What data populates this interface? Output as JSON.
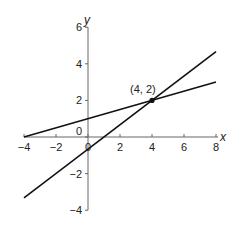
{
  "chart_data": {
    "type": "line",
    "title": "",
    "xlabel": "x",
    "ylabel": "y",
    "xlim": [
      -4,
      8
    ],
    "ylim": [
      -4,
      6
    ],
    "grid": false,
    "x_ticks": [
      -4,
      -2,
      0,
      2,
      4,
      6,
      8
    ],
    "y_ticks": [
      -4,
      -2,
      0,
      2,
      4,
      6
    ],
    "x_tick_labels": [
      "−4",
      "−2",
      "0",
      "2",
      "4",
      "6",
      "8"
    ],
    "y_tick_labels": [
      "−4",
      "−2",
      "0",
      "2",
      "4",
      "6"
    ],
    "series": [
      {
        "name": "line 1",
        "equation": "y = x/4 + 1",
        "x": [
          -4,
          8
        ],
        "y": [
          0,
          3
        ]
      },
      {
        "name": "line 2",
        "equation": "y = (2x − 2)/3",
        "x": [
          -4,
          8
        ],
        "y": [
          -3.33,
          4.67
        ]
      }
    ],
    "points": [
      {
        "x": 4,
        "y": 2,
        "label": "(4, 2)"
      }
    ],
    "annotations": [
      {
        "text": "(4, 2)",
        "x": 4,
        "y": 2
      }
    ],
    "legend": null
  },
  "labels": {
    "x_axis": "x",
    "y_axis": "y",
    "point": "(4, 2)",
    "origin_zero": "0"
  },
  "colors": {
    "line": "#111111",
    "axis": "#666666"
  }
}
